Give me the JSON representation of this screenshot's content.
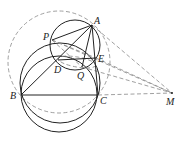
{
  "figure": {
    "type": "geometry-diagram",
    "points": {
      "A": {
        "label": "A",
        "x": 92,
        "y": 25
      },
      "P": {
        "label": "P",
        "x": 52,
        "y": 40
      },
      "D": {
        "label": "D",
        "x": 58,
        "y": 60
      },
      "E": {
        "label": "E",
        "x": 96,
        "y": 58
      },
      "Q": {
        "label": "Q",
        "x": 82,
        "y": 67
      },
      "B": {
        "label": "B",
        "x": 21,
        "y": 95
      },
      "C": {
        "label": "C",
        "x": 98,
        "y": 95
      },
      "M": {
        "label": "M",
        "x": 172,
        "y": 93
      }
    },
    "solid_segments": [
      "AB",
      "AC",
      "BC",
      "AP",
      "AD",
      "AQ",
      "AE",
      "DE"
    ],
    "dashed_segments": [
      "AM",
      "EM",
      "QM",
      "PM",
      "CM",
      "PE",
      "PQ",
      "DQ"
    ],
    "circles": [
      {
        "name": "circle-ADE",
        "style": "solid"
      },
      {
        "name": "circle-BDEC-upper",
        "style": "solid"
      },
      {
        "name": "circle-BQC-lower",
        "style": "solid"
      },
      {
        "name": "circumcircle-ABC",
        "style": "dashed"
      }
    ]
  }
}
